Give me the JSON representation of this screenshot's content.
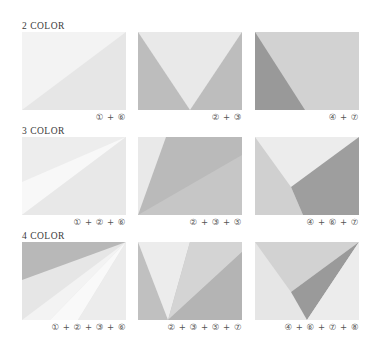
{
  "colors": {
    "c1": "#f4f4f4",
    "c2": "#ececec",
    "c3": "#e2e2e2",
    "c4": "#c7c7c7",
    "c5": "#bdbdbd",
    "c6": "#a6a6a6",
    "c7": "#d6d6d6",
    "c8": "#8c8c8c"
  },
  "rows": [
    {
      "heading": "2 COLOR",
      "panels": [
        {
          "caption": "① + ⑥"
        },
        {
          "caption": "② + ③"
        },
        {
          "caption": "④ + ⑦"
        }
      ]
    },
    {
      "heading": "3 COLOR",
      "panels": [
        {
          "caption": "① + ② + ⑥"
        },
        {
          "caption": "② + ③ + ⑤"
        },
        {
          "caption": "④ + ⑥ + ⑦"
        }
      ]
    },
    {
      "heading": "4 COLOR",
      "panels": [
        {
          "caption": "① + ② + ③ + ⑥"
        },
        {
          "caption": "② + ③ + ⑤ + ⑦"
        },
        {
          "caption": "④ + ⑥ + ⑦ + ⑧"
        }
      ]
    }
  ]
}
